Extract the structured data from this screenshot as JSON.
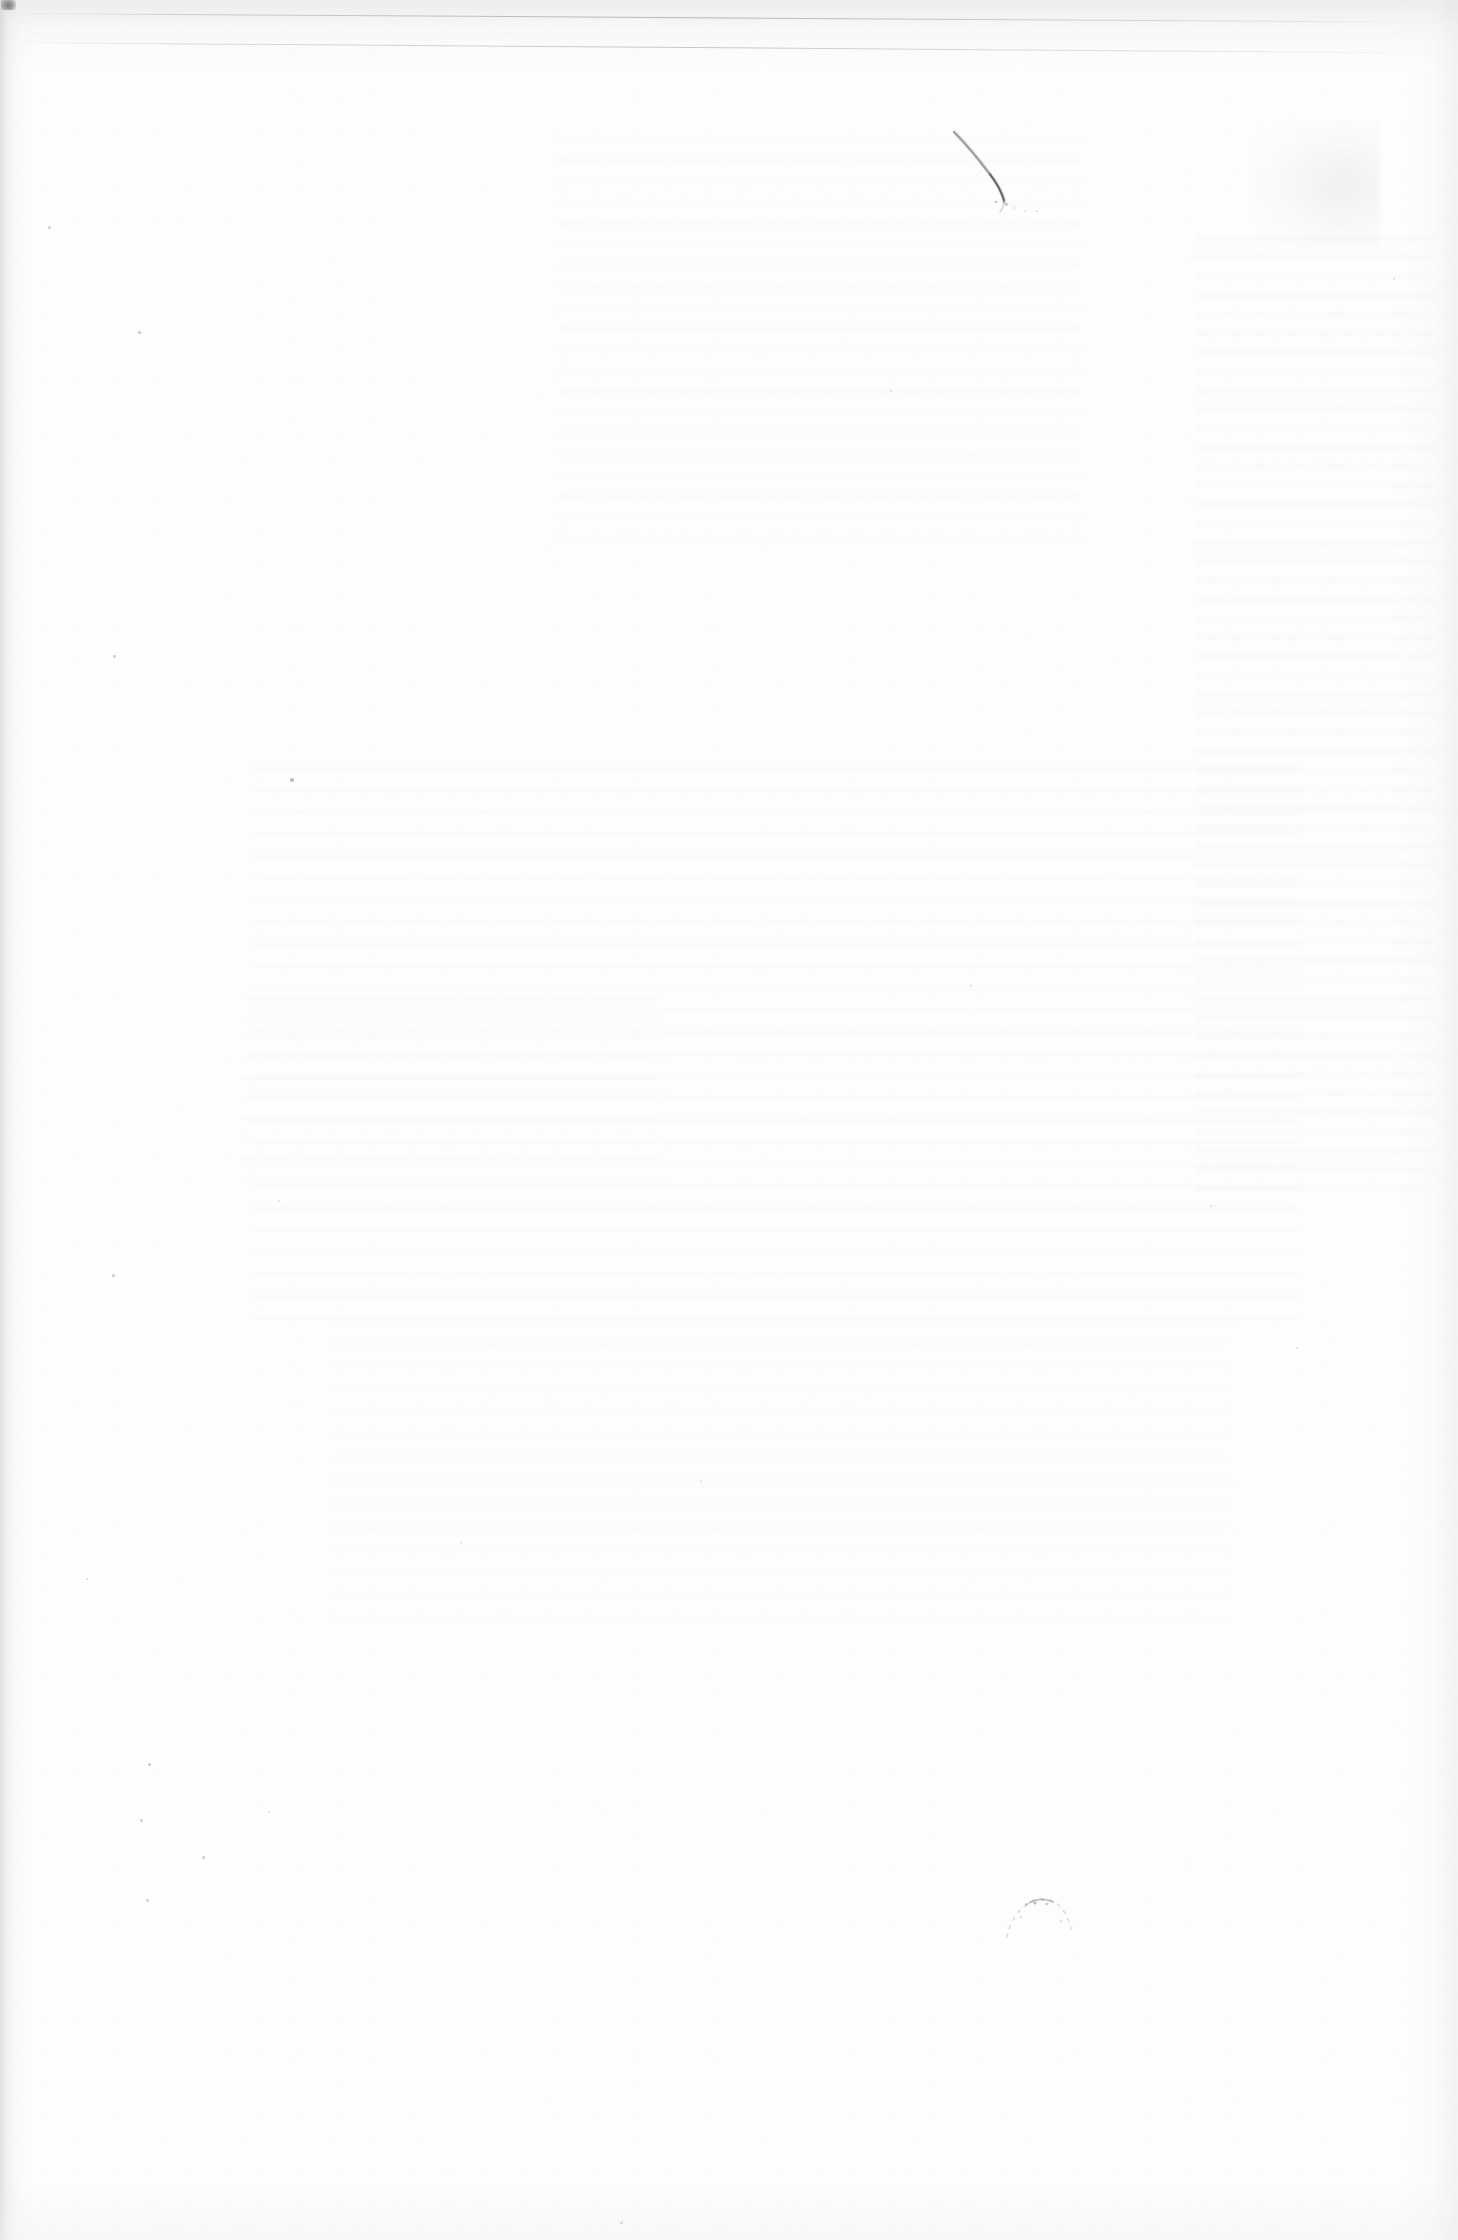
{
  "document": {
    "type": "scanned-page",
    "page_content": "blank",
    "visible_text": "",
    "description": "Blank verso of a scanned paper sheet — no printed or handwritten text is legible."
  },
  "page": {
    "width_px": 1458,
    "height_px": 2240,
    "background_color": "#fcfcfc",
    "paper_tone": "#fdfdfd",
    "shadow_color": "#c4c4c6"
  },
  "artifacts": {
    "corner_blotch": {
      "name": "corner-blotch",
      "x": 1,
      "y": 0,
      "width": 15,
      "height": 12,
      "color": "#404044"
    },
    "scan_edge_lines": [
      {
        "name": "scan-edge-line-upper",
        "y": 13,
        "tilt_deg": 0.35,
        "color": "#84848e"
      },
      {
        "name": "scan-edge-line-lower",
        "y": 42,
        "tilt_deg": 0.42,
        "color": "#9e9ea6"
      }
    ],
    "ink_stroke": {
      "name": "ink-pen-stroke",
      "x": 930,
      "y": 110,
      "width": 150,
      "height": 130,
      "color": "#6a6a72",
      "shape": "curved descending stroke from upper-left to lower-right"
    },
    "smudge_arc": {
      "name": "smudge-arc",
      "x": 995,
      "y": 1885,
      "width": 90,
      "height": 70,
      "color": "#9a9aa2"
    },
    "show_through_blocks": [
      {
        "name": "show-through-upper-right",
        "x": 560,
        "y": 120,
        "width": 520,
        "height": 420
      },
      {
        "name": "show-through-right-margin",
        "x": 1195,
        "y": 230,
        "width": 240,
        "height": 960
      },
      {
        "name": "show-through-mid-body",
        "x": 250,
        "y": 760,
        "width": 1050,
        "height": 560
      },
      {
        "name": "show-through-lower-body",
        "x": 330,
        "y": 1320,
        "width": 900,
        "height": 300
      },
      {
        "name": "show-through-corner-patch",
        "x": 1255,
        "y": 120,
        "width": 125,
        "height": 130
      },
      {
        "name": "show-through-centre-left",
        "x": 240,
        "y": 980,
        "width": 420,
        "height": 200
      }
    ],
    "specks": [
      {
        "x": 48,
        "y": 226,
        "size": 3.0,
        "opacity": 0.55
      },
      {
        "x": 138,
        "y": 331,
        "size": 3.4,
        "opacity": 0.62
      },
      {
        "x": 290,
        "y": 778,
        "size": 3.6,
        "opacity": 0.72
      },
      {
        "x": 113,
        "y": 655,
        "size": 2.8,
        "opacity": 0.5
      },
      {
        "x": 112,
        "y": 1274,
        "size": 3.2,
        "opacity": 0.58
      },
      {
        "x": 86,
        "y": 1578,
        "size": 2.4,
        "opacity": 0.42
      },
      {
        "x": 202,
        "y": 1856,
        "size": 3.0,
        "opacity": 0.55
      },
      {
        "x": 146,
        "y": 1899,
        "size": 2.6,
        "opacity": 0.45
      },
      {
        "x": 148,
        "y": 1763,
        "size": 3.4,
        "opacity": 0.6
      },
      {
        "x": 268,
        "y": 1811,
        "size": 2.4,
        "opacity": 0.42
      },
      {
        "x": 140,
        "y": 1819,
        "size": 2.6,
        "opacity": 0.46
      },
      {
        "x": 278,
        "y": 1200,
        "size": 2.2,
        "opacity": 0.38
      },
      {
        "x": 620,
        "y": 2221,
        "size": 3.0,
        "opacity": 0.5
      },
      {
        "x": 1025,
        "y": 1903,
        "size": 2.8,
        "opacity": 0.52
      },
      {
        "x": 1042,
        "y": 1899,
        "size": 2.4,
        "opacity": 0.46
      },
      {
        "x": 1005,
        "y": 203,
        "size": 2.6,
        "opacity": 0.5
      },
      {
        "x": 1036,
        "y": 210,
        "size": 2.2,
        "opacity": 0.42
      },
      {
        "x": 1296,
        "y": 1347,
        "size": 2.2,
        "opacity": 0.36
      },
      {
        "x": 1393,
        "y": 278,
        "size": 2.4,
        "opacity": 0.4
      },
      {
        "x": 890,
        "y": 390,
        "size": 2.2,
        "opacity": 0.35
      },
      {
        "x": 1210,
        "y": 1205,
        "size": 2.4,
        "opacity": 0.38
      },
      {
        "x": 700,
        "y": 1480,
        "size": 2.0,
        "opacity": 0.3
      },
      {
        "x": 460,
        "y": 1542,
        "size": 2.0,
        "opacity": 0.3
      },
      {
        "x": 970,
        "y": 985,
        "size": 2.2,
        "opacity": 0.34
      }
    ]
  }
}
